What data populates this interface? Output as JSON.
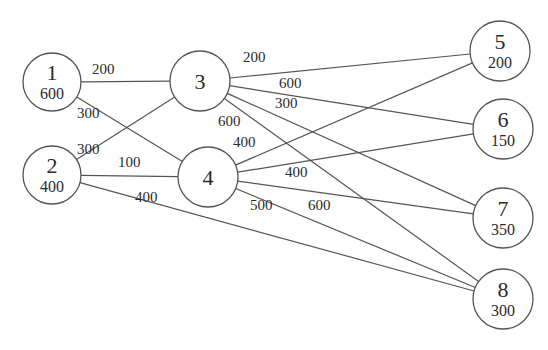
{
  "diagram": {
    "type": "network",
    "nodes": [
      {
        "id": "1",
        "value": "600",
        "x": 52,
        "y": 82,
        "r": 29
      },
      {
        "id": "2",
        "value": "400",
        "x": 52,
        "y": 175,
        "r": 29
      },
      {
        "id": "3",
        "value": "",
        "x": 200,
        "y": 81,
        "r": 30
      },
      {
        "id": "4",
        "value": "",
        "x": 208,
        "y": 177,
        "r": 30
      },
      {
        "id": "5",
        "value": "200",
        "x": 500,
        "y": 51,
        "r": 30
      },
      {
        "id": "6",
        "value": "150",
        "x": 503,
        "y": 129,
        "r": 30
      },
      {
        "id": "7",
        "value": "350",
        "x": 503,
        "y": 218,
        "r": 30
      },
      {
        "id": "8",
        "value": "300",
        "x": 503,
        "y": 299,
        "r": 30
      }
    ],
    "edges": [
      {
        "from": "1",
        "to": "3",
        "label": "200",
        "lx": 92,
        "ly": 74
      },
      {
        "from": "1",
        "to": "4",
        "label": "300",
        "lx": 77,
        "ly": 118
      },
      {
        "from": "2",
        "to": "3",
        "label": "300",
        "lx": 77,
        "ly": 154
      },
      {
        "from": "2",
        "to": "4",
        "label": "100",
        "lx": 118,
        "ly": 167
      },
      {
        "from": "2",
        "to": "8",
        "label": "400",
        "lx": 135,
        "ly": 202
      },
      {
        "from": "3",
        "to": "5",
        "label": "200",
        "lx": 243,
        "ly": 62
      },
      {
        "from": "3",
        "to": "6",
        "label": "600",
        "lx": 279,
        "ly": 88
      },
      {
        "from": "3",
        "to": "7",
        "label": "300",
        "lx": 275,
        "ly": 108
      },
      {
        "from": "3",
        "to": "8",
        "label": "600",
        "lx": 218,
        "ly": 126
      },
      {
        "from": "4",
        "to": "5",
        "label": "400",
        "lx": 233,
        "ly": 147
      },
      {
        "from": "4",
        "to": "6",
        "label": "400",
        "lx": 285,
        "ly": 177
      },
      {
        "from": "4",
        "to": "7",
        "label": "500",
        "lx": 250,
        "ly": 210
      },
      {
        "from": "4",
        "to": "8",
        "label": "600",
        "lx": 308,
        "ly": 210
      }
    ]
  }
}
